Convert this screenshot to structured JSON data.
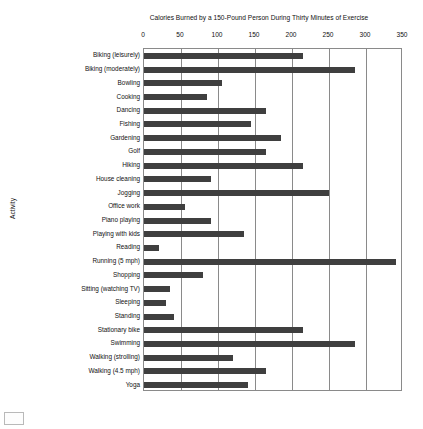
{
  "chart_data": {
    "type": "bar",
    "orientation": "horizontal",
    "title": "Calories Burned by a 150-Pound Person During Thirty Minutes of Exercise",
    "xlabel": "",
    "ylabel": "Activity",
    "xlim": [
      0,
      350
    ],
    "xticks": [
      0,
      50,
      100,
      150,
      200,
      250,
      300,
      350
    ],
    "xtick_labels": [
      "0",
      "50",
      "100",
      "150",
      "200",
      "250",
      "300",
      "350"
    ],
    "grid": true,
    "legend": false,
    "bar_color": "#3f3f3f",
    "categories": [
      "Biking (leisurely)",
      "Biking (moderately)",
      "Bowling",
      "Cooking",
      "Dancing",
      "Fishing",
      "Gardening",
      "Golf",
      "Hiking",
      "House cleaning",
      "Jogging",
      "Office work",
      "Piano playing",
      "Playing with kids",
      "Reading",
      "Running (5 mph)",
      "Shopping",
      "Sitting (watching TV)",
      "Sleeping",
      "Standing",
      "Stationary bike",
      "Swimming",
      "Walking (strolling)",
      "Walking (4.5 mph)",
      "Yoga"
    ],
    "values": [
      215,
      285,
      105,
      85,
      165,
      145,
      185,
      165,
      215,
      90,
      250,
      55,
      90,
      135,
      20,
      340,
      80,
      35,
      30,
      40,
      215,
      285,
      120,
      165,
      140
    ]
  }
}
